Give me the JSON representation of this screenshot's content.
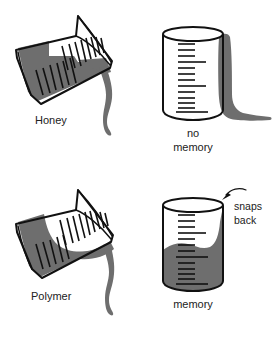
{
  "figure": {
    "background_color": "#ffffff",
    "ink_color": "#111111",
    "fluid_color": "#6e6e6e",
    "fluid_color_dark": "#5e5e5e"
  },
  "panels": {
    "top_left": {
      "label": "Honey",
      "beaker_state": "tilted-pouring",
      "fluid_surface": "flat"
    },
    "top_right": {
      "label_line1": "no",
      "label_line2": "memory",
      "beaker_state": "upright-empty",
      "fluid_state": "drained-down-side"
    },
    "bottom_left": {
      "label": "Polymer",
      "beaker_state": "tilted-pouring",
      "fluid_surface": "curved"
    },
    "bottom_right": {
      "label": "memory",
      "annotation_line1": "snaps",
      "annotation_line2": "back",
      "beaker_state": "upright-filled",
      "fluid_state": "recoiled-up-side"
    }
  },
  "graduations": {
    "count_upright": 13,
    "count_tilted": 14
  }
}
